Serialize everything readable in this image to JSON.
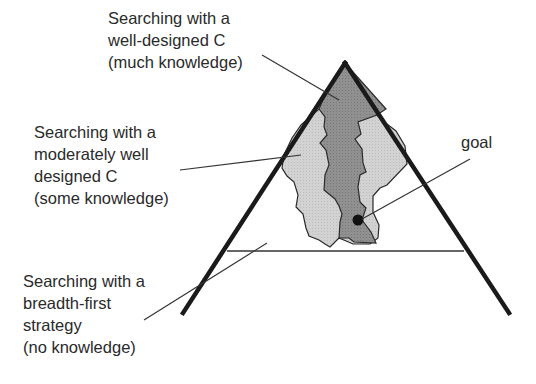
{
  "diagram": {
    "type": "search-space-triangle",
    "colors": {
      "outline": "#1a1a1a",
      "dark_region": "#8c8c8c",
      "light_region": "#cfcfcf",
      "leader_line": "#333333",
      "text": "#2a2a2a",
      "goal_dot": "#111111"
    },
    "labels": {
      "well_designed": {
        "lines": [
          "Searching with a",
          "well-designed C",
          "(much knowledge)"
        ]
      },
      "moderately_designed": {
        "lines": [
          "Searching with a",
          "moderately well",
          "designed C",
          "(some knowledge)"
        ]
      },
      "breadth_first": {
        "lines": [
          "Searching with a",
          "breadth-first",
          "strategy",
          "(no knowledge)"
        ]
      },
      "goal": {
        "lines": [
          "goal"
        ]
      }
    }
  }
}
